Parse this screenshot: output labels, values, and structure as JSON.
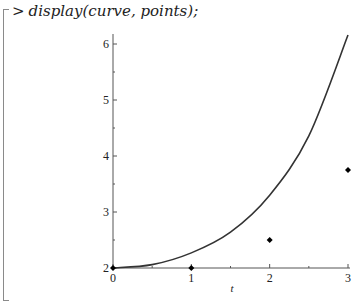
{
  "worksheet": {
    "prompt": ">",
    "command": "display(curve, points);"
  },
  "chart_data": {
    "type": "line",
    "title": "",
    "xlabel": "t",
    "ylabel": "",
    "xlim": [
      0,
      3
    ],
    "ylim": [
      2,
      6.2
    ],
    "x_ticks": [
      "0",
      "1",
      "2",
      "3"
    ],
    "y_ticks": [
      "2",
      "3",
      "4",
      "5",
      "6"
    ],
    "grid": false,
    "legend": null,
    "series": [
      {
        "name": "curve",
        "type": "line",
        "x": [
          0,
          0.5,
          1,
          1.5,
          2,
          2.5,
          3
        ],
        "values": [
          2.0,
          2.06,
          2.27,
          2.64,
          3.3,
          4.36,
          6.16
        ],
        "color": "#333333"
      },
      {
        "name": "points",
        "type": "scatter",
        "x": [
          0,
          1,
          2,
          3
        ],
        "values": [
          2,
          2,
          2.5,
          3.75
        ],
        "color": "#000000"
      }
    ]
  }
}
